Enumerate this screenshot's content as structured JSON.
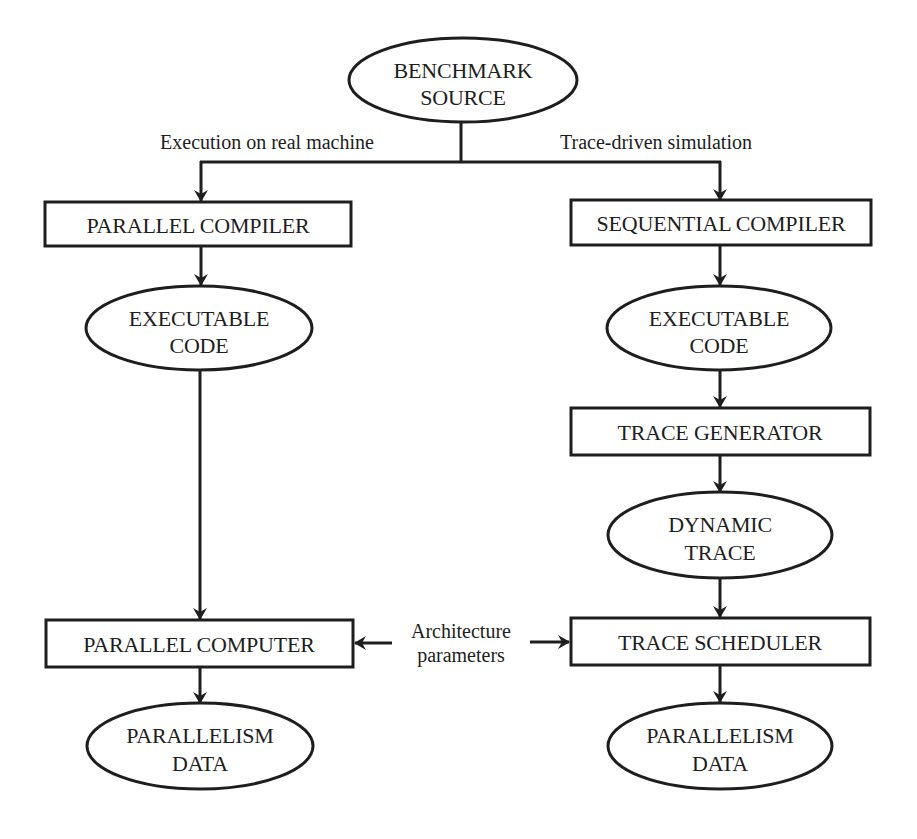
{
  "diagram": {
    "type": "flowchart",
    "branches": {
      "left_label": "Execution on real machine",
      "right_label": "Trace-driven simulation"
    },
    "nodes": {
      "benchmark_source": {
        "shape": "ellipse",
        "line1": "BENCHMARK",
        "line2": "SOURCE"
      },
      "parallel_compiler": {
        "shape": "rect",
        "label": "PARALLEL COMPILER"
      },
      "sequential_compiler": {
        "shape": "rect",
        "label": "SEQUENTIAL COMPILER"
      },
      "exec_code_left": {
        "shape": "ellipse",
        "line1": "EXECUTABLE",
        "line2": "CODE"
      },
      "exec_code_right": {
        "shape": "ellipse",
        "line1": "EXECUTABLE",
        "line2": "CODE"
      },
      "trace_generator": {
        "shape": "rect",
        "label": "TRACE GENERATOR"
      },
      "dynamic_trace": {
        "shape": "ellipse",
        "line1": "DYNAMIC",
        "line2": "TRACE"
      },
      "parallel_computer": {
        "shape": "rect",
        "label": "PARALLEL COMPUTER"
      },
      "trace_scheduler": {
        "shape": "rect",
        "label": "TRACE SCHEDULER"
      },
      "parallelism_data_left": {
        "shape": "ellipse",
        "line1": "PARALLELISM",
        "line2": "DATA"
      },
      "parallelism_data_right": {
        "shape": "ellipse",
        "line1": "PARALLELISM",
        "line2": "DATA"
      }
    },
    "side_input": {
      "line1": "Architecture",
      "line2": "parameters",
      "targets": [
        "PARALLEL COMPUTER",
        "TRACE SCHEDULER"
      ]
    },
    "edges": [
      {
        "from": "BENCHMARK SOURCE",
        "to": "PARALLEL COMPILER",
        "label": "Execution on real machine"
      },
      {
        "from": "BENCHMARK SOURCE",
        "to": "SEQUENTIAL COMPILER",
        "label": "Trace-driven simulation"
      },
      {
        "from": "PARALLEL COMPILER",
        "to": "EXECUTABLE CODE (left)"
      },
      {
        "from": "EXECUTABLE CODE (left)",
        "to": "PARALLEL COMPUTER"
      },
      {
        "from": "PARALLEL COMPUTER",
        "to": "PARALLELISM DATA (left)"
      },
      {
        "from": "SEQUENTIAL COMPILER",
        "to": "EXECUTABLE CODE (right)"
      },
      {
        "from": "EXECUTABLE CODE (right)",
        "to": "TRACE GENERATOR"
      },
      {
        "from": "TRACE GENERATOR",
        "to": "DYNAMIC TRACE"
      },
      {
        "from": "DYNAMIC TRACE",
        "to": "TRACE SCHEDULER"
      },
      {
        "from": "TRACE SCHEDULER",
        "to": "PARALLELISM DATA (right)"
      },
      {
        "from": "Architecture parameters",
        "to": "PARALLEL COMPUTER"
      },
      {
        "from": "Architecture parameters",
        "to": "TRACE SCHEDULER"
      }
    ],
    "colors": {
      "ink": "#1e1e1e",
      "background": "#ffffff"
    }
  }
}
